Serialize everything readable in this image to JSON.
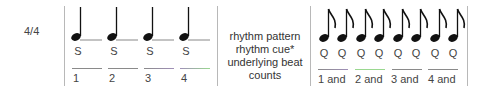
{
  "time_signature": "4/4",
  "left_measure": {
    "note_type": "quarter-note",
    "cues": [
      "S",
      "S",
      "S",
      "S"
    ],
    "counts": [
      "1",
      "2",
      "3",
      "4"
    ]
  },
  "legend": {
    "rows": [
      "rhythm pattern",
      "rhythm cue*",
      "underlying beat",
      "counts"
    ]
  },
  "right_measure": {
    "note_type": "eighth-note",
    "cues": [
      "Q",
      "Q",
      "Q",
      "Q",
      "Q",
      "Q",
      "Q",
      "Q"
    ],
    "counts": [
      "1 and",
      "2 and",
      "3 and",
      "4 and"
    ]
  },
  "colors": {
    "beat_line_gray": "#8a8a8a",
    "beat_line_purple": "#9a88b0",
    "beat_line_green": "#9ad890",
    "bar_line": "#b8b8b8",
    "note": "#111111"
  }
}
